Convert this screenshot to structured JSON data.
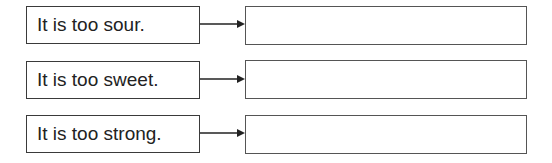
{
  "rows": [
    {
      "prompt": "It is too sour.",
      "answer": ""
    },
    {
      "prompt": "It is too sweet.",
      "answer": ""
    },
    {
      "prompt": "It is too strong.",
      "answer": ""
    }
  ]
}
